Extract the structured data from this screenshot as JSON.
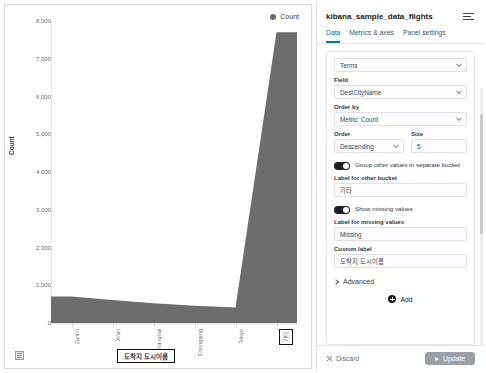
{
  "chart_data": {
    "type": "area",
    "title": "",
    "categories": [
      "Zurich",
      "Xi'an",
      "Shanghai",
      "Chongqing",
      "Tokyo",
      "기타"
    ],
    "values": [
      700,
      610,
      520,
      460,
      410,
      7700
    ],
    "series": [
      {
        "name": "Count",
        "values": [
          700,
          610,
          520,
          460,
          410,
          7700
        ]
      }
    ],
    "xlabel": "도착지 도시이름",
    "ylabel": "Count",
    "ylim": [
      0,
      8000
    ],
    "ytick_labels": [
      "8,000",
      "7,000",
      "6,000",
      "5,000",
      "4,000",
      "3,000",
      "2,000",
      "1,000",
      "0"
    ],
    "ytick_values": [
      8000,
      7000,
      6000,
      5000,
      4000,
      3000,
      2000,
      1000,
      0
    ],
    "grid": false,
    "legend": {
      "position": "top-right",
      "entries": [
        "Count"
      ]
    },
    "series_color": "#6d6d6d",
    "annotations": [
      {
        "text": "도착지 도시이름",
        "style": "black-box",
        "target": "x-axis-title"
      },
      {
        "text": "기타",
        "style": "black-box",
        "target": "x-axis-last-tick"
      }
    ]
  },
  "chart": {
    "legend_label": "Count",
    "y_axis_title": "Count",
    "x_axis_title": "도착지 도시이름",
    "table_toggle_name": "data-table-toggle"
  },
  "panel": {
    "title": "kibana_sample_data_flights",
    "menu_icon": "list-menu-icon",
    "tabs": [
      {
        "label": "Data",
        "active": true
      },
      {
        "label": "Metrics & axes",
        "active": false
      },
      {
        "label": "Panel settings",
        "active": false
      }
    ],
    "aggregation": {
      "value": "Terms"
    },
    "field": {
      "label": "Field",
      "value": "DestCityName"
    },
    "order_by": {
      "label": "Order by",
      "value": "Metric: Count"
    },
    "order": {
      "label": "Order",
      "value": "Descending"
    },
    "size": {
      "label": "Size",
      "value": "5"
    },
    "group_other": {
      "label": "Group other values in separate bucket",
      "enabled": true
    },
    "other_bucket_label": {
      "label": "Label for other bucket",
      "value": "기타"
    },
    "show_missing": {
      "label": "Show missing values",
      "enabled": true
    },
    "missing_label": {
      "label": "Label for missing values",
      "value": "Missing"
    },
    "custom_label": {
      "label": "Custom label",
      "value": "도착지 도시이름"
    },
    "advanced": {
      "label": "Advanced"
    },
    "add": {
      "label": "Add"
    },
    "footer": {
      "discard_label": "Discard",
      "update_label": "Update"
    }
  },
  "colors": {
    "accent": "#0071c2",
    "series": "#6d6d6d",
    "update_button": "#9aa0a8",
    "toggle_on": "#1d1e24"
  }
}
